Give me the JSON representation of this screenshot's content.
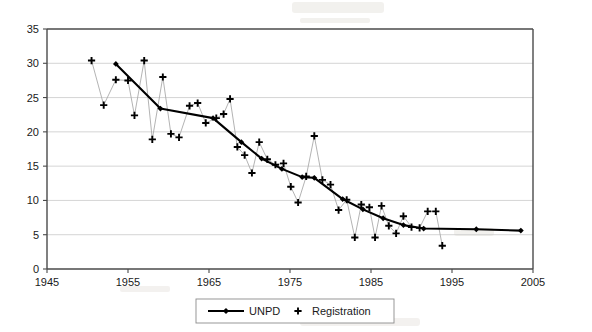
{
  "chart_data": {
    "type": "line",
    "title": "",
    "xlabel": "",
    "ylabel": "",
    "xlim": [
      1945,
      2005
    ],
    "ylim": [
      0,
      35
    ],
    "xticks": [
      1945,
      1955,
      1965,
      1975,
      1985,
      1995,
      2005
    ],
    "yticks": [
      0,
      5,
      10,
      15,
      20,
      25,
      30,
      35
    ],
    "grid": true,
    "legend_position": "bottom-center",
    "series": [
      {
        "name": "UNPD",
        "marker": "diamond",
        "line": true,
        "color": "#000000",
        "points": [
          [
            1953.5,
            29.9
          ],
          [
            1959.0,
            23.4
          ],
          [
            1965.5,
            22.0
          ],
          [
            1969.0,
            18.5
          ],
          [
            1971.5,
            16.1
          ],
          [
            1974.0,
            14.6
          ],
          [
            1976.5,
            13.4
          ],
          [
            1978.0,
            13.3
          ],
          [
            1981.5,
            10.2
          ],
          [
            1984.0,
            8.7
          ],
          [
            1986.5,
            7.4
          ],
          [
            1989.0,
            6.4
          ],
          [
            1991.5,
            5.9
          ],
          [
            1998.0,
            5.8
          ],
          [
            2003.5,
            5.6
          ]
        ]
      },
      {
        "name": "Registration",
        "marker": "plus",
        "line": false,
        "color": "#000000",
        "points": [
          [
            1950.5,
            30.4
          ],
          [
            1952.0,
            23.9
          ],
          [
            1953.5,
            27.6
          ],
          [
            1955.0,
            27.5
          ],
          [
            1955.8,
            22.4
          ],
          [
            1957.0,
            30.4
          ],
          [
            1958.0,
            18.9
          ],
          [
            1959.3,
            28.0
          ],
          [
            1960.3,
            19.7
          ],
          [
            1961.3,
            19.2
          ],
          [
            1962.6,
            23.8
          ],
          [
            1963.6,
            24.2
          ],
          [
            1964.6,
            21.3
          ],
          [
            1965.9,
            22.0
          ],
          [
            1966.8,
            22.6
          ],
          [
            1967.6,
            24.8
          ],
          [
            1968.5,
            17.8
          ],
          [
            1969.4,
            16.6
          ],
          [
            1970.3,
            14.0
          ],
          [
            1971.2,
            18.5
          ],
          [
            1972.2,
            16.0
          ],
          [
            1973.2,
            15.2
          ],
          [
            1974.2,
            15.4
          ],
          [
            1975.1,
            12.0
          ],
          [
            1976.0,
            9.7
          ],
          [
            1977.0,
            13.5
          ],
          [
            1978.0,
            19.4
          ],
          [
            1979.0,
            13.0
          ],
          [
            1980.0,
            12.3
          ],
          [
            1981.0,
            8.6
          ],
          [
            1982.0,
            10.1
          ],
          [
            1983.0,
            4.6
          ],
          [
            1983.8,
            9.4
          ],
          [
            1984.8,
            9.0
          ],
          [
            1985.5,
            4.6
          ],
          [
            1986.3,
            9.2
          ],
          [
            1987.2,
            6.3
          ],
          [
            1988.1,
            5.2
          ],
          [
            1989.0,
            7.7
          ],
          [
            1990.0,
            6.1
          ],
          [
            1991.0,
            6.0
          ],
          [
            1992.0,
            8.4
          ],
          [
            1993.0,
            8.4
          ],
          [
            1993.8,
            3.4
          ]
        ]
      }
    ]
  },
  "legend": {
    "items": [
      {
        "label": "UNPD",
        "marker": "diamond-line"
      },
      {
        "label": "Registration",
        "marker": "plus"
      }
    ]
  }
}
